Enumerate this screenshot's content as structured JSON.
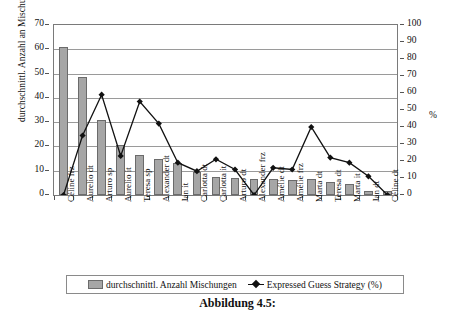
{
  "figure": {
    "caption": "Abbildung 4.5:"
  },
  "legend": {
    "position": "bottom",
    "items": [
      {
        "label": "durchschnittl. Anzahl Mischungen",
        "marker": "bar-swatch-icon",
        "color": "#a6a6a6"
      },
      {
        "label": "Expressed Guess Strategy (%)",
        "marker": "line-diamond-icon",
        "color": "#111111"
      }
    ]
  },
  "chart_data": {
    "type": "bar",
    "title": "",
    "xlabel": "",
    "ylabel": "durchschnittl. Anzahl an Mischungen",
    "ylabel_secondary": "%",
    "ylim": [
      0,
      70
    ],
    "ylim_secondary": [
      0,
      100
    ],
    "yticks": [
      0,
      10,
      20,
      30,
      40,
      50,
      60,
      70
    ],
    "yticks_secondary": [
      0,
      10,
      20,
      30,
      40,
      50,
      60,
      70,
      80,
      90,
      100
    ],
    "grid": true,
    "categories": [
      "Céline frz",
      "Aurelio dt",
      "Arturo sp",
      "Aurelio it",
      "Teresa sp",
      "Alexander dt",
      "Jan it",
      "Carlotta dt",
      "Carlotta it",
      "Arturo dt",
      "Alexander frz",
      "Amélie dt",
      "Amélie frz",
      "Marta dt",
      "Teresa dt",
      "Marta it",
      "Jan dt",
      "Céline dt"
    ],
    "series": [
      {
        "name": "durchschnittl. Anzahl Mischungen",
        "axis": "left",
        "type": "bar",
        "color": "#a6a6a6",
        "values": [
          61,
          48.5,
          31,
          20.5,
          16.5,
          15,
          13,
          9.5,
          7.5,
          7,
          6.5,
          6.5,
          6,
          6.5,
          5.5,
          4.5,
          1.5,
          1.5
        ]
      },
      {
        "name": "Expressed Guess Strategy (%)",
        "axis": "right",
        "type": "line",
        "color": "#111111",
        "values": [
          0,
          35,
          59,
          23,
          55,
          42,
          19,
          14,
          21,
          15,
          0,
          16,
          15,
          40,
          22,
          19,
          11,
          0
        ]
      }
    ]
  }
}
